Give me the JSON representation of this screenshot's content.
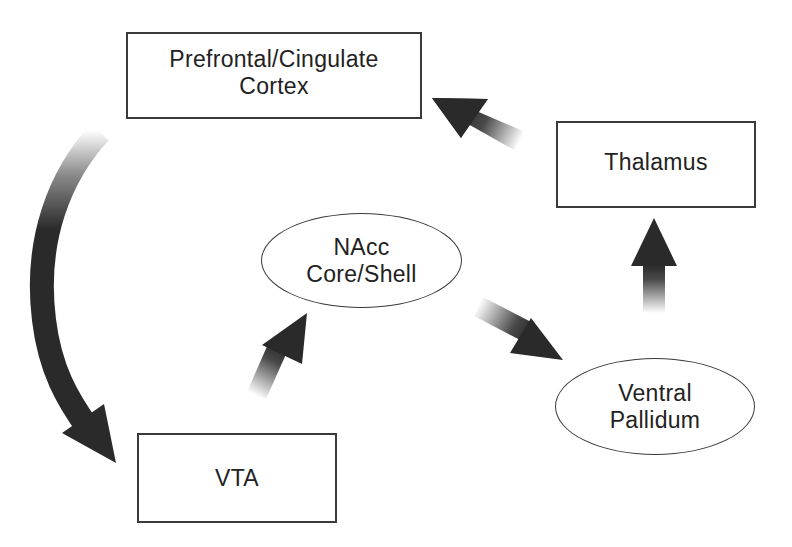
{
  "diagram": {
    "type": "neural circuit flow diagram",
    "nodes": [
      {
        "id": "cortex",
        "shape": "rectangle",
        "lines": [
          "Prefrontal/Cingulate",
          "Cortex"
        ]
      },
      {
        "id": "thalamus",
        "shape": "rectangle",
        "lines": [
          "Thalamus"
        ]
      },
      {
        "id": "nacc",
        "shape": "ellipse",
        "lines": [
          "NAcc",
          "Core/Shell"
        ]
      },
      {
        "id": "vp",
        "shape": "ellipse",
        "lines": [
          "Ventral",
          "Pallidum"
        ]
      },
      {
        "id": "vta",
        "shape": "rectangle",
        "lines": [
          "VTA"
        ]
      }
    ],
    "edges": [
      {
        "from": "cortex",
        "to": "vta",
        "style": "curved gradient arrow"
      },
      {
        "from": "vta",
        "to": "nacc",
        "style": "straight gradient arrow"
      },
      {
        "from": "nacc",
        "to": "vp",
        "style": "straight gradient arrow"
      },
      {
        "from": "vp",
        "to": "thalamus",
        "style": "straight gradient arrow"
      },
      {
        "from": "thalamus",
        "to": "cortex",
        "style": "straight gradient arrow"
      }
    ],
    "colors": {
      "arrow": "#2a2a2a",
      "border": "#3a3a3a",
      "text": "#222222",
      "background": "#ffffff"
    }
  }
}
